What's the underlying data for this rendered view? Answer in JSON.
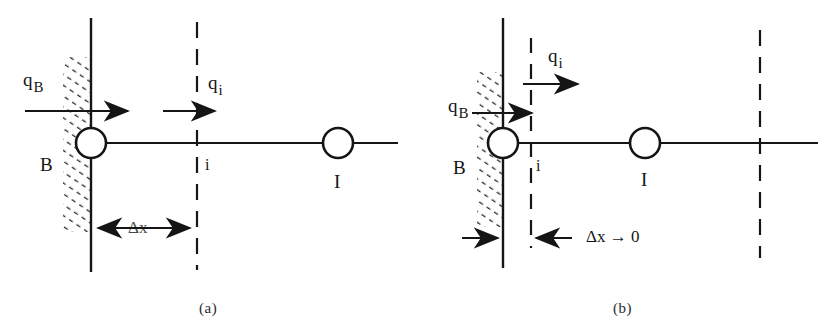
{
  "figure": {
    "panels": [
      {
        "id": "a",
        "caption": "(a)",
        "labels": {
          "flux_boundary": "q",
          "flux_boundary_sub": "B",
          "flux_interior": "q",
          "flux_interior_sub": "i",
          "node_boundary": "B",
          "node_interior": "i",
          "node_far": "I",
          "dimension": "Δx"
        }
      },
      {
        "id": "b",
        "caption": "(b)",
        "labels": {
          "flux_boundary": "q",
          "flux_boundary_sub": "B",
          "flux_interior": "q",
          "flux_interior_sub": "i",
          "node_boundary": "B",
          "node_interior": "i",
          "node_far": "I",
          "dimension": "Δx → 0"
        }
      }
    ],
    "colors": {
      "ink": "#151515",
      "background": "#ffffff",
      "hatch": "#2b2b2b"
    }
  }
}
